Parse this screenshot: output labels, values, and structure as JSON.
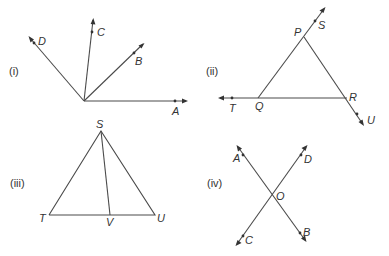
{
  "figures": [
    {
      "id": "i",
      "label": "(i)",
      "description": "Four rays OA, OB, OC, OD from a common vertex",
      "points": {
        "A": "A",
        "B": "B",
        "C": "C",
        "D": "D"
      }
    },
    {
      "id": "ii",
      "label": "(ii)",
      "description": "Triangle PQR with extended sides to S, T, U",
      "points": {
        "P": "P",
        "Q": "Q",
        "R": "R",
        "S": "S",
        "T": "T",
        "U": "U"
      }
    },
    {
      "id": "iii",
      "label": "(iii)",
      "description": "Triangle STU with segment SV",
      "points": {
        "S": "S",
        "T": "T",
        "U": "U",
        "V": "V"
      }
    },
    {
      "id": "iv",
      "label": "(iv)",
      "description": "Two intersecting lines AB and CD meeting at O",
      "points": {
        "A": "A",
        "B": "B",
        "C": "C",
        "D": "D",
        "O": "O"
      }
    }
  ]
}
